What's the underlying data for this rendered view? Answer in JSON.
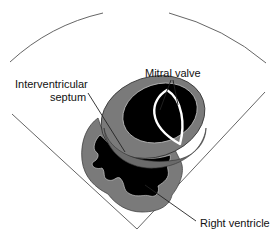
{
  "diagram": {
    "type": "echocardiogram-parasternal-short-axis-schematic",
    "labels": {
      "mitral_valve": "Mitral valve",
      "septum_line1": "Interventricular",
      "septum_line2": "septum",
      "right_ventricle": "Right ventricle"
    },
    "colors": {
      "background": "#ffffff",
      "myocardium": "#7a7a7a",
      "cavity": "#000000",
      "valve": "#ffffff",
      "lines": "#555555",
      "text": "#111111"
    }
  }
}
